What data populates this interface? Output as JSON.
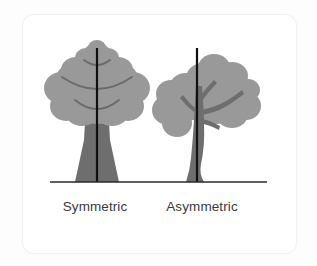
{
  "figure": {
    "background_color": "#fdfdfd",
    "card_color": "#ffffff",
    "card_border_color": "#f1f1f1"
  },
  "ground": {
    "color": "#2b2b2b",
    "x_start": 50,
    "x_end": 267,
    "y": 182,
    "thickness": 1.6
  },
  "palette": {
    "canopy": "#999999",
    "canopy_edge": "#939393",
    "trunk": "#6e6e6e",
    "branch_line": "#6b6b6b",
    "axis_line": "#101010",
    "label_text": "#3a3a3a"
  },
  "trees": [
    {
      "id": "symmetric",
      "label": "Symmetric",
      "label_center_x": 95,
      "axis_x": 97,
      "axis_top_y": 48,
      "axis_bottom_y": 182,
      "canopy_center_x": 97,
      "canopy_style": "tiered-rounded",
      "balanced": "true"
    },
    {
      "id": "asymmetric",
      "label": "Asymmetric",
      "label_center_x": 202,
      "axis_x": 197,
      "axis_top_y": 48,
      "axis_bottom_y": 182,
      "canopy_center_x": 212,
      "canopy_style": "irregular-cluster",
      "balanced": "false"
    }
  ]
}
